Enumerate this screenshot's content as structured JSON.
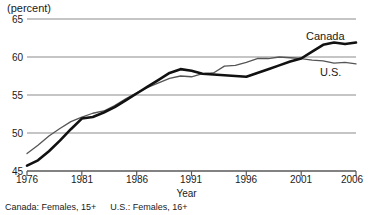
{
  "axis_unit_label": "(percent)",
  "xaxis_title": "Year",
  "series_labels": {
    "canada": "Canada",
    "us": "U.S."
  },
  "footnote": {
    "canada": "Canada: Females, 15+",
    "us": "U.S.: Females, 16+"
  },
  "colors": {
    "canada_line": "#000000",
    "us_line": "#4d4d4d",
    "gridline": "#999999",
    "axis": "#666666",
    "text": "#1a1a1a"
  },
  "chart_data": {
    "type": "line",
    "title": "",
    "subtitle": "",
    "xlabel": "Year",
    "ylabel": "(percent)",
    "xlim": [
      1976,
      2006
    ],
    "ylim": [
      45,
      65
    ],
    "xticks": [
      1976,
      1981,
      1986,
      1991,
      1996,
      2001,
      2006
    ],
    "yticks": [
      45,
      50,
      55,
      60,
      65
    ],
    "grid": true,
    "legend_position": "inline-right",
    "x": [
      1976,
      1977,
      1978,
      1979,
      1980,
      1981,
      1982,
      1983,
      1984,
      1985,
      1986,
      1987,
      1988,
      1989,
      1990,
      1991,
      1992,
      1993,
      1994,
      1995,
      1996,
      1997,
      1998,
      1999,
      2000,
      2001,
      2002,
      2003,
      2004,
      2005,
      2006
    ],
    "series": [
      {
        "name": "Canada",
        "note": "Canada: Females, 15+",
        "values": [
          45.7,
          46.4,
          47.6,
          49.0,
          50.5,
          51.9,
          52.1,
          52.7,
          53.4,
          54.3,
          55.2,
          56.1,
          57.0,
          57.9,
          58.4,
          58.2,
          57.8,
          57.7,
          57.6,
          57.5,
          57.4,
          57.9,
          58.4,
          58.9,
          59.4,
          59.8,
          60.7,
          61.6,
          61.9,
          61.7,
          61.9
        ]
      },
      {
        "name": "U.S.",
        "note": "U.S.: Females, 16+",
        "values": [
          47.3,
          48.4,
          49.6,
          50.6,
          51.5,
          52.1,
          52.6,
          52.9,
          53.6,
          54.5,
          55.3,
          56.0,
          56.6,
          57.2,
          57.5,
          57.4,
          57.8,
          57.9,
          58.8,
          58.9,
          59.3,
          59.8,
          59.8,
          60.0,
          59.9,
          59.8,
          59.6,
          59.5,
          59.2,
          59.3,
          59.1
        ]
      }
    ]
  }
}
